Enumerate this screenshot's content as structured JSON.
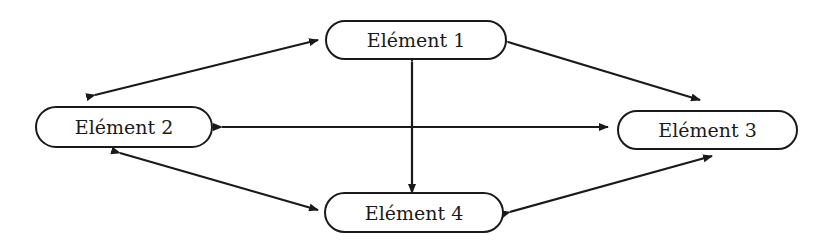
{
  "diagram": {
    "nodes": [
      {
        "id": "n1",
        "label": "Elément 1"
      },
      {
        "id": "n2",
        "label": "Elément 2"
      },
      {
        "id": "n3",
        "label": "Elément 3"
      },
      {
        "id": "n4",
        "label": "Elément 4"
      }
    ],
    "edges": [
      {
        "from": "Elément 1",
        "to": "Elément 2",
        "type": "bidirectional"
      },
      {
        "from": "Elément 1",
        "to": "Elément 3",
        "type": "bidirectional"
      },
      {
        "from": "Elément 1",
        "to": "Elément 4",
        "type": "bidirectional"
      },
      {
        "from": "Elément 2",
        "to": "Elément 3",
        "type": "bidirectional"
      },
      {
        "from": "Elément 2",
        "to": "Elément 4",
        "type": "bidirectional"
      },
      {
        "from": "Elément 3",
        "to": "Elément 4",
        "type": "bidirectional"
      }
    ],
    "colors": {
      "stroke": "#1a1a1a",
      "background": "#ffffff"
    }
  }
}
